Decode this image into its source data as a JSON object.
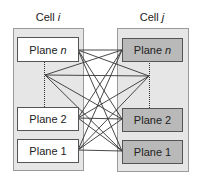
{
  "diagram": {
    "cells": [
      {
        "id": "cell_i",
        "label_prefix": "Cell",
        "label_var": "i",
        "planes": [
          {
            "prefix": "Plane",
            "var": "n"
          },
          {
            "prefix": "Plane",
            "var": "2"
          },
          {
            "prefix": "Plane",
            "var": "1"
          }
        ]
      },
      {
        "id": "cell_j",
        "label_prefix": "Cell",
        "label_var": "j",
        "planes": [
          {
            "prefix": "Plane",
            "var": "n"
          },
          {
            "prefix": "Plane",
            "var": "2"
          },
          {
            "prefix": "Plane",
            "var": "1"
          }
        ]
      }
    ],
    "connections": "all-to-all between planes of Cell i and Cell j (including elided intermediate planes)",
    "colors": {
      "cell_background": "#e6e6e6",
      "cell_i_plane_fill": "#ffffff",
      "cell_j_plane_fill": "#b9b9b9",
      "line": "#333333"
    }
  }
}
